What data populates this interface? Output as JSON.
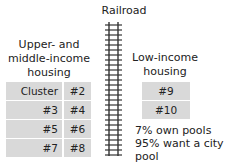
{
  "title": "Railroad",
  "colors": {
    "cell_bg": "#d9d9d9",
    "text": "#222222",
    "track": "#333333"
  },
  "left_group": {
    "label_lines": [
      "Upper- and",
      "middle-income",
      "housing"
    ],
    "clusters": [
      [
        "Cluster #1",
        "#2"
      ],
      [
        "#3",
        "#4"
      ],
      [
        "#5",
        "#6"
      ],
      [
        "#7",
        "#8"
      ]
    ]
  },
  "right_group": {
    "label_lines": [
      "Low-income",
      "housing"
    ],
    "clusters": [
      "#9",
      "#10"
    ],
    "notes": [
      "7% own pools",
      "95% want a city pool"
    ]
  }
}
